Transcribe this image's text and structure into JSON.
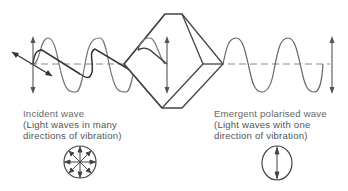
{
  "diagram": {
    "type": "polarisation-of-light",
    "colors": {
      "stroke": "#444444",
      "wave_light": "#666666",
      "axis_dash": "#888888",
      "text": "#555555",
      "background": "#ffffff"
    },
    "incident": {
      "title": "Incident wave",
      "line1": "(Light waves in many",
      "line2": "directions of vibration)",
      "symbol": "multi-direction-vibration-icon"
    },
    "emergent": {
      "title": "Emergent polarised wave",
      "line1": "(Light waves with one",
      "line2": "direction of vibration)",
      "symbol": "single-direction-vibration-icon"
    },
    "polariser": "polarising-crystal-prism"
  }
}
